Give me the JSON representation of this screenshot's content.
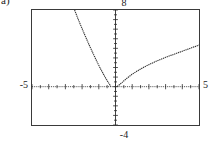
{
  "figure": {
    "part_label": "a)",
    "caption": ""
  },
  "calculator": {
    "window_labels": {
      "ymax": "8",
      "ymin": "-4",
      "xmin": "-5",
      "xmax": "5"
    },
    "axis_names": {
      "x": "x-axis",
      "y": "y-axis"
    }
  },
  "chart_data": {
    "type": "line",
    "title": "",
    "subtitle": "",
    "xlabel": "",
    "ylabel": "",
    "xlim": [
      -5,
      5
    ],
    "ylim": [
      -4,
      8
    ],
    "grid": false,
    "legend": null,
    "axes": {
      "x_axis_y_value": 0,
      "y_axis_x_value": 0,
      "x_tick_interval": 0.5,
      "y_tick_interval": 0.5,
      "tick_style": "dotted-marks"
    },
    "tick_labels": {
      "x": [
        "-5",
        "5"
      ],
      "y": [
        "-4",
        "8"
      ]
    },
    "annotations": [
      {
        "text": "8",
        "position": "top-center-outside",
        "meaning": "window Ymax"
      },
      {
        "text": "-4",
        "position": "bottom-center-outside",
        "meaning": "window Ymin"
      },
      {
        "text": "-5",
        "position": "left-outside-on-x-axis",
        "meaning": "window Xmin"
      },
      {
        "text": "5",
        "position": "right-outside-on-x-axis",
        "meaning": "window Xmax"
      },
      {
        "text": "a)",
        "position": "top-left-outside",
        "meaning": "figure part label"
      }
    ],
    "series": [
      {
        "name": "left-branch",
        "style": "dotted",
        "color": "#333333",
        "x": [
          -2.45,
          -2.35,
          -2.25,
          -2.15,
          -2.05,
          -1.95,
          -1.85,
          -1.75,
          -1.65,
          -1.55,
          -1.45,
          -1.35,
          -1.25,
          -1.15,
          -1.05,
          -0.95,
          -0.85,
          -0.75,
          -0.65,
          -0.55,
          -0.45,
          -0.38,
          -0.32,
          -0.28
        ],
        "y": [
          8.0,
          7.55,
          7.1,
          6.68,
          6.26,
          5.85,
          5.44,
          5.04,
          4.64,
          4.25,
          3.87,
          3.49,
          3.12,
          2.76,
          2.4,
          2.05,
          1.72,
          1.4,
          1.08,
          0.78,
          0.5,
          0.3,
          0.14,
          0.02
        ]
      },
      {
        "name": "right-branch",
        "style": "dotted",
        "color": "#333333",
        "x": [
          0.1,
          0.25,
          0.4,
          0.6,
          0.8,
          1.0,
          1.25,
          1.5,
          1.75,
          2.0,
          2.25,
          2.5,
          2.75,
          3.0,
          3.25,
          3.5,
          3.75,
          4.0,
          4.25,
          4.5,
          4.75,
          5.0
        ],
        "y": [
          0.02,
          0.22,
          0.45,
          0.76,
          1.04,
          1.3,
          1.58,
          1.84,
          2.08,
          2.3,
          2.5,
          2.7,
          2.88,
          3.06,
          3.22,
          3.38,
          3.54,
          3.7,
          3.86,
          4.02,
          4.18,
          4.34
        ]
      }
    ]
  }
}
